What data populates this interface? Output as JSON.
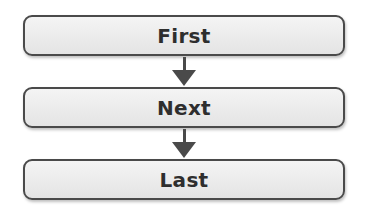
{
  "diagram": {
    "type": "vertical-flowchart",
    "nodes": [
      {
        "label": "First"
      },
      {
        "label": "Next"
      },
      {
        "label": "Last"
      }
    ],
    "edges": [
      {
        "from": "First",
        "to": "Next"
      },
      {
        "from": "Next",
        "to": "Last"
      }
    ],
    "colors": {
      "border": "#4a4a4a",
      "fill": "#ececec",
      "text": "#2e2e2e"
    }
  }
}
